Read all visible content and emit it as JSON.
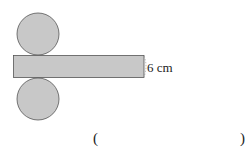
{
  "diagram": {
    "fill_color": "#c8c8c8",
    "stroke_color": "#555555",
    "height_label": "6 cm"
  },
  "answer": {
    "open_paren": "(",
    "close_paren": ")"
  }
}
